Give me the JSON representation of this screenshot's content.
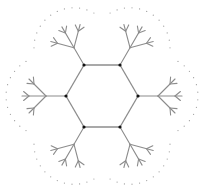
{
  "diagram": {
    "type": "hexagonal-cayley-tree",
    "canvas": {
      "width": 208,
      "height": 189
    },
    "center": [
      102,
      96
    ],
    "hexagon": {
      "vertices": [
        [
          84,
          65
        ],
        [
          120,
          65
        ],
        [
          138,
          96
        ],
        [
          120,
          127
        ],
        [
          84,
          127
        ],
        [
          66,
          96
        ]
      ],
      "edge_color": "#8c8c8c",
      "vertex_color": "#111111"
    },
    "trees": {
      "count": 6,
      "trunk_length": 20,
      "branch_length": 24,
      "branch_angles_deg": [
        -45,
        0,
        45
      ],
      "fork_length": 7,
      "fork_angles_deg": [
        -40,
        40
      ],
      "line_color": "#8c8c8c"
    },
    "continuation_dots": {
      "radius_from_trunk_end": 40,
      "arc_span_deg": 120,
      "count_per_arc": 12,
      "color": "#9a9a9a"
    }
  }
}
